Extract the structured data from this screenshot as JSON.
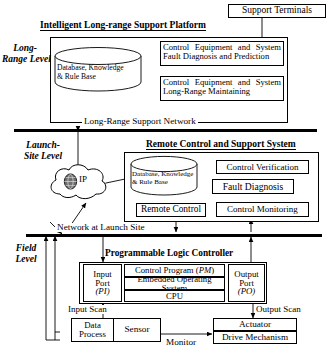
{
  "diagram": {
    "levels": [
      {
        "name": "long-range-level",
        "label": "Long-\nRange Level"
      },
      {
        "name": "launch-site-level",
        "label": "Launch-\nSite Level"
      },
      {
        "name": "field-level",
        "label": "Field\nLevel"
      }
    ]
  },
  "long_range": {
    "platform_title": "Intelligent Long-range Support Platform",
    "support_terminals": "Support Terminals",
    "database": "Database,  Knowledge\n& Rule Base",
    "database_line1": "Database,  Knowledge",
    "database_line2": "& Rule Base",
    "box_fault": "Control Equipment and System Fault Diagnosis and Prediction",
    "box_fault_line1": "Control Equipment and System",
    "box_fault_line2": "Fault Diagnosis and Prediction",
    "box_maintain": "Control Equipment and System Long-Range Maintaining",
    "box_maintain_line1": "Control Equipment and System",
    "box_maintain_line2": "Long-Range Maintaining",
    "network_label": "Long-Range Support Network"
  },
  "launch_site": {
    "system_title": "Remote Control and Support System",
    "cloud_label": "IP",
    "database_line1": "Database,  Knowledge",
    "database_line2": "& Rule Base",
    "control_verification": "Control Verification",
    "fault_diagnosis": "Fault Diagnosis",
    "remote_control": "Remote Control",
    "control_monitoring": "Control Monitoring",
    "network_label": "Network at Launch Site"
  },
  "field": {
    "plc_title": "Programmable Logic Controller",
    "input_port_line1": "Input",
    "input_port_line2": "Port",
    "input_port_line3": "(PI)",
    "output_port_line1": "Output",
    "output_port_line2": "Port",
    "output_port_line3": "(PO)",
    "control_program": "Control Program (PM)",
    "control_program_plain": "Control Program",
    "control_program_italic": "PM",
    "embedded_os": "Embedded Operating System",
    "cpu": "CPU",
    "input_scan": "Input Scan",
    "output_scan": "Output Scan",
    "data_process_line1": "Data",
    "data_process_line2": "Process",
    "sensor": "Sensor",
    "monitor": "Monitor",
    "actuator": "Actuator",
    "drive_mechanism": "Drive Mechanism"
  },
  "colors": {
    "line": "#000000",
    "background": "#ffffff",
    "shadow": "#9a9a9a"
  }
}
